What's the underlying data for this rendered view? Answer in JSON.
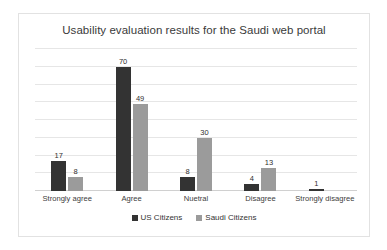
{
  "chart_data": {
    "type": "bar",
    "title": "Usability evaluation results for the Saudi web portal",
    "xlabel": "",
    "ylabel": "",
    "ylim": [
      0,
      80
    ],
    "grid": true,
    "y_tick_labels_visible": false,
    "gridline_step": 10,
    "legend_position": "bottom",
    "categories": [
      "Strongly agree",
      "Agree",
      "Nuetral",
      "Disagree",
      "Strongly disagree"
    ],
    "series": [
      {
        "name": "US Citizens",
        "color": "#333333",
        "values": [
          17,
          70,
          8,
          4,
          1
        ],
        "labels": [
          "17",
          "70",
          "8",
          "4",
          "1"
        ]
      },
      {
        "name": "Saudi Citizens",
        "color": "#9b9b9b",
        "values": [
          8,
          49,
          30,
          13,
          0
        ],
        "labels": [
          "8",
          "49",
          "30",
          "13",
          ""
        ]
      }
    ]
  },
  "frame": {
    "border_color": "#e2e2e2",
    "background": "#ffffff"
  }
}
